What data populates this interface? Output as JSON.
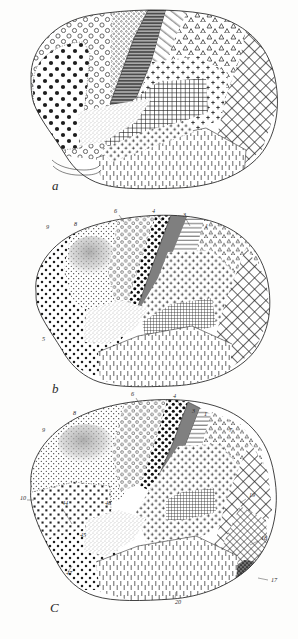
{
  "figure": {
    "background_color": "#fdfdfc",
    "ink_color": "#222222",
    "panel_count": 3
  },
  "panels": [
    {
      "id": "panel-a",
      "letter": "a",
      "caption_position": "bottom-left",
      "description": "Lateral view of hemisphere subdivided into textured cortical fields; no numeric labels shown",
      "labels": [],
      "regions": [
        {
          "name": "frontal-pole-small-circles",
          "pattern": "open-circles",
          "fill": "#ffffff"
        },
        {
          "name": "frontal-large-dots",
          "pattern": "large-filled-dots",
          "fill": "#ffffff"
        },
        {
          "name": "precentral-dense-circles",
          "pattern": "dense-small-circles",
          "fill": "#ffffff"
        },
        {
          "name": "central-dark-band",
          "pattern": "dark-horizontal-lines",
          "fill": "#8a8a8a"
        },
        {
          "name": "postcentral-diagonal",
          "pattern": "diagonal-lines",
          "fill": "#ffffff"
        },
        {
          "name": "parietal-triangles",
          "pattern": "open-triangles",
          "fill": "#ffffff"
        },
        {
          "name": "superior-parietal-crosses",
          "pattern": "filled-crosses",
          "fill": "#ffffff"
        },
        {
          "name": "supramarginal-crosshatch",
          "pattern": "fine-grid",
          "fill": "#ffffff"
        },
        {
          "name": "occipital-lattice",
          "pattern": "diagonal-lattice",
          "fill": "#ffffff"
        },
        {
          "name": "temporal-vertical-dashes",
          "pattern": "vertical-dashes",
          "fill": "#ffffff"
        },
        {
          "name": "insular-stipple",
          "pattern": "fine-stipple",
          "fill": "#ffffff"
        }
      ]
    },
    {
      "id": "panel-b",
      "letter": "b",
      "caption_position": "bottom-left",
      "description": "Lateral view with numbered cortical fields",
      "labels": [
        {
          "text": "9",
          "x": 46,
          "y": 229
        },
        {
          "text": "8",
          "x": 74,
          "y": 226
        },
        {
          "text": "6",
          "x": 114,
          "y": 213
        },
        {
          "text": "4",
          "x": 152,
          "y": 213
        },
        {
          "text": "3",
          "x": 183,
          "y": 217
        },
        {
          "text": "1",
          "x": 205,
          "y": 228
        },
        {
          "text": "5",
          "x": 42,
          "y": 341
        }
      ],
      "regions": [
        {
          "name": "prefrontal-dots",
          "pattern": "medium-dots",
          "fill": "#ffffff"
        },
        {
          "name": "area-9-gray-wash",
          "pattern": "gray-wash",
          "fill": "#cfcfcf"
        },
        {
          "name": "area-8-open-circles",
          "pattern": "open-circles",
          "fill": "#ffffff"
        },
        {
          "name": "area-6-circle-rows",
          "pattern": "open-circle-rows",
          "fill": "#ffffff"
        },
        {
          "name": "area-4-filled-dots",
          "pattern": "bold-filled-dots",
          "fill": "#ffffff"
        },
        {
          "name": "area-3-dark-band",
          "pattern": "solid-gray",
          "fill": "#7f7f7f"
        },
        {
          "name": "area-1-horizontal-lines",
          "pattern": "horizontal-lines",
          "fill": "#ffffff"
        },
        {
          "name": "parietal-triangles",
          "pattern": "open-triangles",
          "fill": "#ffffff"
        },
        {
          "name": "parietal-crosses",
          "pattern": "filled-crosses",
          "fill": "#ffffff"
        },
        {
          "name": "angular-crosshatch",
          "pattern": "fine-grid",
          "fill": "#ffffff"
        },
        {
          "name": "occipital-lattice",
          "pattern": "diagonal-lattice",
          "fill": "#ffffff"
        },
        {
          "name": "temporal-vertical-dashes",
          "pattern": "vertical-dashes",
          "fill": "#ffffff"
        },
        {
          "name": "insula-stipple",
          "pattern": "fine-stipple",
          "fill": "#ffffff"
        }
      ]
    },
    {
      "id": "panel-c",
      "letter": "C",
      "caption_position": "bottom-left",
      "description": "Lateral view with numbered cortical fields, most fully labelled panel",
      "labels": [
        {
          "text": "8",
          "x": 73,
          "y": 415
        },
        {
          "text": "9",
          "x": 42,
          "y": 432
        },
        {
          "text": "6",
          "x": 131,
          "y": 396
        },
        {
          "text": "4",
          "x": 173,
          "y": 398
        },
        {
          "text": "3",
          "x": 192,
          "y": 413
        },
        {
          "text": "1",
          "x": 204,
          "y": 416
        },
        {
          "text": "7",
          "x": 229,
          "y": 432
        },
        {
          "text": "19",
          "x": 249,
          "y": 497
        },
        {
          "text": "18",
          "x": 261,
          "y": 540
        },
        {
          "text": "17",
          "x": 271,
          "y": 582
        },
        {
          "text": "20",
          "x": 175,
          "y": 604
        },
        {
          "text": "10",
          "x": 20,
          "y": 500
        },
        {
          "text": "44",
          "x": 62,
          "y": 505
        },
        {
          "text": "45",
          "x": 80,
          "y": 537
        },
        {
          "text": "47",
          "x": 66,
          "y": 575
        },
        {
          "text": "46",
          "x": 105,
          "y": 505
        }
      ],
      "regions": [
        {
          "name": "area-10-squares",
          "pattern": "small-squares",
          "fill": "#ffffff"
        },
        {
          "name": "area-9-gray-wash",
          "pattern": "gray-wash",
          "fill": "#d2d2d2"
        },
        {
          "name": "area-8-fine-dots",
          "pattern": "fine-dots",
          "fill": "#ffffff"
        },
        {
          "name": "area-6-open-circles",
          "pattern": "open-circles",
          "fill": "#ffffff"
        },
        {
          "name": "area-4-filled-dots",
          "pattern": "bold-filled-dots",
          "fill": "#ffffff"
        },
        {
          "name": "area-3-gray-band",
          "pattern": "solid-gray",
          "fill": "#808080"
        },
        {
          "name": "area-1-horizontal-lines",
          "pattern": "horizontal-lines",
          "fill": "#ffffff"
        },
        {
          "name": "area-7-triangles",
          "pattern": "open-triangles",
          "fill": "#ffffff"
        },
        {
          "name": "parietal-crosses",
          "pattern": "filled-crosses",
          "fill": "#ffffff"
        },
        {
          "name": "area-19-lattice",
          "pattern": "diagonal-lattice",
          "fill": "#ffffff"
        },
        {
          "name": "area-18-lattice-dense",
          "pattern": "dense-lattice",
          "fill": "#ffffff"
        },
        {
          "name": "area-17-dark",
          "pattern": "dark-stipple",
          "fill": "#5a5a5a"
        },
        {
          "name": "area-20-vertical-dashes",
          "pattern": "vertical-dashes",
          "fill": "#ffffff"
        },
        {
          "name": "area-44-45-47-dots",
          "pattern": "medium-dots",
          "fill": "#ffffff"
        },
        {
          "name": "insula-stipple",
          "pattern": "fine-stipple",
          "fill": "#ffffff"
        }
      ]
    }
  ]
}
